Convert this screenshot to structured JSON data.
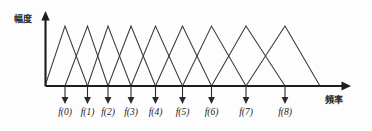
{
  "figure": {
    "name": "triangular-filter-bank-diagram",
    "background_color": "#fdfdfd",
    "line_color": "#3a3a3a",
    "axis_color": "#1d1d1d"
  },
  "axes": {
    "y_label": "幅度",
    "x_label": "頻率"
  },
  "chart_data": {
    "type": "line",
    "title": "",
    "subtitle": "",
    "xlabel": "頻率",
    "ylabel": "幅度",
    "grid": false,
    "legend": false,
    "annotations": [],
    "xlim": [
      0,
      372
    ],
    "ylim": [
      0,
      1
    ],
    "tick_labels": [
      "f(0)",
      "f(1)",
      "f(2)",
      "f(3)",
      "f(4)",
      "f(5)",
      "f(6)",
      "f(7)",
      "f(8)"
    ],
    "tick_positions": [
      65,
      87.5,
      108,
      131,
      155.5,
      182.5,
      211.5,
      246,
      285
    ],
    "peak_value": 1,
    "series": [
      {
        "name": "filter-0",
        "peak_x": 65,
        "left_x": 45,
        "right_x": 87.5,
        "values": [
          0,
          1,
          0
        ]
      },
      {
        "name": "filter-1",
        "peak_x": 87.5,
        "left_x": 65,
        "right_x": 108,
        "values": [
          0,
          1,
          0
        ]
      },
      {
        "name": "filter-2",
        "peak_x": 108,
        "left_x": 87.5,
        "right_x": 131,
        "values": [
          0,
          1,
          0
        ]
      },
      {
        "name": "filter-3",
        "peak_x": 131,
        "left_x": 108,
        "right_x": 155.5,
        "values": [
          0,
          1,
          0
        ]
      },
      {
        "name": "filter-4",
        "peak_x": 155.5,
        "left_x": 131,
        "right_x": 182.5,
        "values": [
          0,
          1,
          0
        ]
      },
      {
        "name": "filter-5",
        "peak_x": 182.5,
        "left_x": 155.5,
        "right_x": 211.5,
        "values": [
          0,
          1,
          0
        ]
      },
      {
        "name": "filter-6",
        "peak_x": 211.5,
        "left_x": 182.5,
        "right_x": 246,
        "values": [
          0,
          1,
          0
        ]
      },
      {
        "name": "filter-7",
        "peak_x": 246,
        "left_x": 211.5,
        "right_x": 285,
        "values": [
          0,
          1,
          0
        ]
      },
      {
        "name": "filter-8",
        "peak_x": 285,
        "left_x": 246,
        "right_x": 320,
        "values": [
          0,
          1,
          0
        ]
      }
    ]
  },
  "geometry": {
    "baseline_y": 86,
    "peak_y": 26,
    "y_axis_x": 45.5,
    "y_axis_top": 14,
    "x_axis_end": 349,
    "pointer_top_y": 86,
    "pointer_bottom_y": 102,
    "tick_label_y": 115,
    "y_label_x": 28,
    "y_label_y": 19,
    "x_label_x": 336,
    "x_label_y": 100
  }
}
